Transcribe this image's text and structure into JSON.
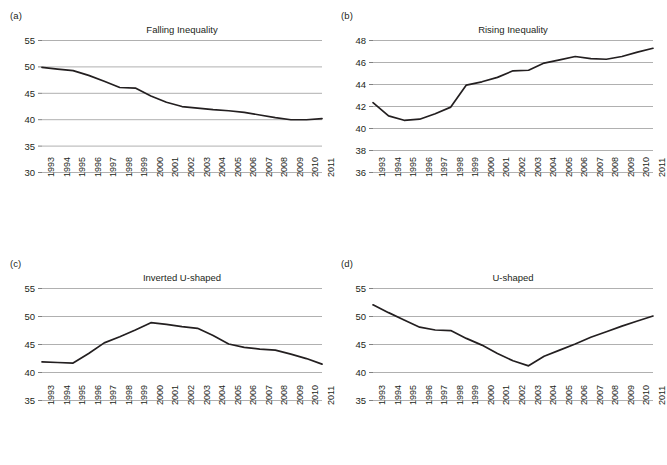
{
  "figure": {
    "background_color": "#ffffff",
    "line_color": "#231f20",
    "grid_color": "#b0b0b0",
    "axis_color": "#808080",
    "text_color": "#231f20"
  },
  "panels": [
    {
      "label": "(a)",
      "title": "Falling Inequality",
      "yticks": [
        "55",
        "50",
        "45",
        "40",
        "35",
        "30"
      ],
      "xticks": [
        "1993",
        "1994",
        "1995",
        "1996",
        "1997",
        "1998",
        "1999",
        "2000",
        "2001",
        "2002",
        "2003",
        "2004",
        "2005",
        "2006",
        "2007",
        "2008",
        "2009",
        "2010",
        "2011"
      ]
    },
    {
      "label": "(b)",
      "title": "Rising Inequality",
      "yticks": [
        "48",
        "46",
        "44",
        "42",
        "40",
        "38",
        "36"
      ],
      "xticks": [
        "1993",
        "1994",
        "1995",
        "1996",
        "1997",
        "1998",
        "1999",
        "2000",
        "2001",
        "2002",
        "2003",
        "2004",
        "2005",
        "2006",
        "2007",
        "2008",
        "2009",
        "2010",
        "2011"
      ]
    },
    {
      "label": "(c)",
      "title": "Inverted U-shaped",
      "yticks": [
        "55",
        "50",
        "45",
        "40",
        "35"
      ],
      "xticks": [
        "1993",
        "1994",
        "1995",
        "1996",
        "1997",
        "1998",
        "1999",
        "2000",
        "2001",
        "2002",
        "2003",
        "2004",
        "2005",
        "2006",
        "2007",
        "2008",
        "2009",
        "2010",
        "2011"
      ]
    },
    {
      "label": "(d)",
      "title": "U-shaped",
      "yticks": [
        "55",
        "50",
        "45",
        "40",
        "35"
      ],
      "xticks": [
        "1993",
        "1994",
        "1995",
        "1996",
        "1997",
        "1998",
        "1999",
        "2000",
        "2001",
        "2002",
        "2003",
        "2004",
        "2005",
        "2006",
        "2007",
        "2008",
        "2009",
        "2010",
        "2011"
      ]
    }
  ],
  "chart_data": [
    {
      "type": "line",
      "panel": "(a)",
      "title": "Falling Inequality",
      "xlabel": "",
      "ylabel": "",
      "grid": true,
      "legend": "none",
      "x": [
        1993,
        1994,
        1995,
        1996,
        1997,
        1998,
        1999,
        2000,
        2001,
        2002,
        2003,
        2004,
        2005,
        2006,
        2007,
        2008,
        2009,
        2010,
        2011
      ],
      "categories": [
        "1993",
        "1994",
        "1995",
        "1996",
        "1997",
        "1998",
        "1999",
        "2000",
        "2001",
        "2002",
        "2003",
        "2004",
        "2005",
        "2006",
        "2007",
        "2008",
        "2009",
        "2010",
        "2011"
      ],
      "values": [
        49.8,
        49.5,
        49.2,
        48.3,
        47.2,
        46.0,
        45.9,
        44.4,
        43.2,
        42.4,
        42.1,
        41.8,
        41.6,
        41.3,
        40.8,
        40.3,
        39.9,
        39.9,
        40.1
      ],
      "ylim": [
        30,
        55
      ],
      "yticks": [
        30,
        35,
        40,
        45,
        50,
        55
      ]
    },
    {
      "type": "line",
      "panel": "(b)",
      "title": "Rising Inequality",
      "xlabel": "",
      "ylabel": "",
      "grid": true,
      "legend": "none",
      "x": [
        1993,
        1994,
        1995,
        1996,
        1997,
        1998,
        1999,
        2000,
        2001,
        2002,
        2003,
        2004,
        2005,
        2006,
        2007,
        2008,
        2009,
        2010,
        2011
      ],
      "categories": [
        "1993",
        "1994",
        "1995",
        "1996",
        "1997",
        "1998",
        "1999",
        "2000",
        "2001",
        "2002",
        "2003",
        "2004",
        "2005",
        "2006",
        "2007",
        "2008",
        "2009",
        "2010",
        "2011"
      ],
      "values": [
        42.3,
        41.1,
        40.7,
        40.8,
        41.3,
        41.9,
        43.9,
        44.2,
        44.6,
        45.2,
        45.25,
        45.9,
        46.2,
        46.5,
        46.3,
        46.25,
        46.5,
        46.9,
        47.25
      ],
      "ylim": [
        36,
        48
      ],
      "yticks": [
        36,
        38,
        40,
        42,
        44,
        46,
        48
      ]
    },
    {
      "type": "line",
      "panel": "(c)",
      "title": "Inverted U-shaped",
      "xlabel": "",
      "ylabel": "",
      "grid": true,
      "legend": "none",
      "x": [
        1993,
        1994,
        1995,
        1996,
        1997,
        1998,
        1999,
        2000,
        2001,
        2002,
        2003,
        2004,
        2005,
        2006,
        2007,
        2008,
        2009,
        2010,
        2011
      ],
      "categories": [
        "1993",
        "1994",
        "1995",
        "1996",
        "1997",
        "1998",
        "1999",
        "2000",
        "2001",
        "2002",
        "2003",
        "2004",
        "2005",
        "2006",
        "2007",
        "2008",
        "2009",
        "2010",
        "2011"
      ],
      "values": [
        41.8,
        41.7,
        41.6,
        43.3,
        45.2,
        46.3,
        47.5,
        48.8,
        48.5,
        48.1,
        47.8,
        46.5,
        45.0,
        44.4,
        44.1,
        43.9,
        43.2,
        42.4,
        41.4
      ],
      "ylim": [
        35,
        55
      ],
      "yticks": [
        35,
        40,
        45,
        50,
        55
      ]
    },
    {
      "type": "line",
      "panel": "(d)",
      "title": "U-shaped",
      "xlabel": "",
      "ylabel": "",
      "grid": true,
      "legend": "none",
      "x": [
        1993,
        1994,
        1995,
        1996,
        1997,
        1998,
        1999,
        2000,
        2001,
        2002,
        2003,
        2004,
        2005,
        2006,
        2007,
        2008,
        2009,
        2010,
        2011
      ],
      "categories": [
        "1993",
        "1994",
        "1995",
        "1996",
        "1997",
        "1998",
        "1999",
        "2000",
        "2001",
        "2002",
        "2003",
        "2004",
        "2005",
        "2006",
        "2007",
        "2008",
        "2009",
        "2010",
        "2011"
      ],
      "values": [
        52.0,
        50.6,
        49.3,
        48.0,
        47.5,
        47.4,
        46.0,
        44.8,
        43.3,
        42.0,
        41.1,
        42.8,
        43.9,
        45.0,
        46.2,
        47.2,
        48.2,
        49.1,
        50.0
      ],
      "ylim": [
        35,
        55
      ],
      "yticks": [
        35,
        40,
        45,
        50,
        55
      ]
    }
  ]
}
